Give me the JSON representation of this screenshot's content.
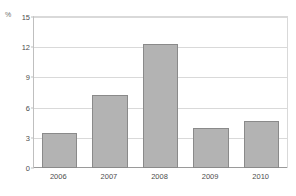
{
  "chart_data": {
    "type": "bar",
    "title": "Inflation",
    "xlabel": "",
    "ylabel": "%",
    "unit": "%",
    "categories": [
      "2006",
      "2007",
      "2008",
      "2009",
      "2010"
    ],
    "values": [
      3.5,
      7.3,
      12.3,
      4.0,
      4.7
    ],
    "series": [
      {
        "name": "Inflation",
        "values": [
          3.5,
          7.3,
          12.3,
          4.0,
          4.7
        ]
      }
    ],
    "ylim": [
      0,
      15
    ],
    "yticks": [
      0,
      3,
      6,
      9,
      12,
      15
    ],
    "ytick_labels": [
      "0",
      "3",
      "6",
      "9",
      "12",
      "15"
    ],
    "grid": true,
    "legend": false,
    "legend_position": "none",
    "bar_color": "#b3b3b3",
    "bar_border_color": "#8a8a8a",
    "gridline_color": "#d9d9d9",
    "axis_color": "#9a9a9a",
    "text_color": "#4d4d4d"
  }
}
